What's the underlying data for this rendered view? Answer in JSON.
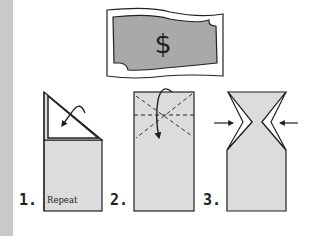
{
  "colors": {
    "bill_fill": "#a9a9a9",
    "paper_fill": "#dcdcdc",
    "stroke": "#222222",
    "side_strip": "#c9c9c9"
  },
  "bill": {
    "symbol": "$",
    "icon": "dollar-bill-icon"
  },
  "steps": [
    {
      "number": "1.",
      "note": "Repeat",
      "icon": "fold-corner-diagonal-icon"
    },
    {
      "number": "2.",
      "note": "",
      "icon": "fold-dashed-crease-icon"
    },
    {
      "number": "3.",
      "note": "",
      "icon": "push-sides-inward-icon"
    }
  ]
}
